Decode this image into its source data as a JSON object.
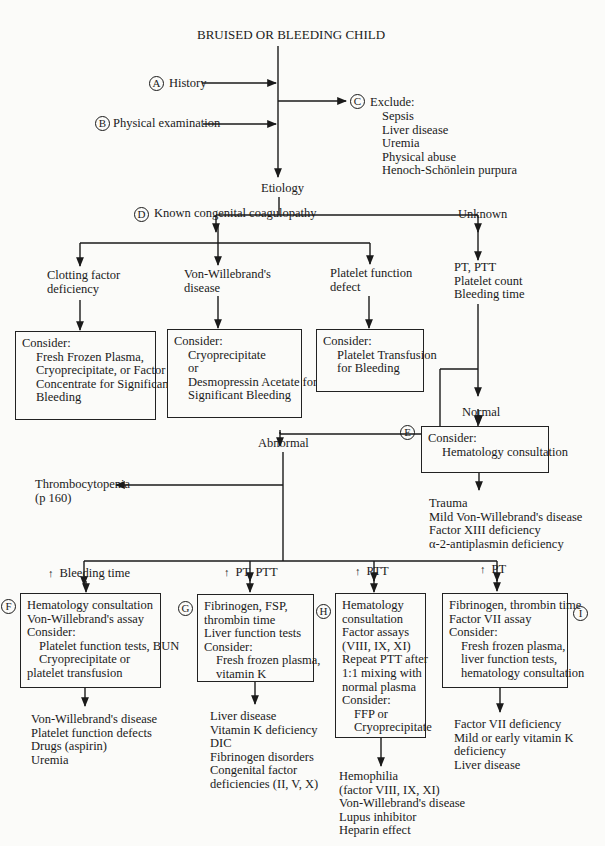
{
  "title": "BRUISED OR BLEEDING CHILD",
  "steps": {
    "A": {
      "letter": "A",
      "label": "History"
    },
    "B": {
      "letter": "B",
      "label": "Physical examination"
    },
    "C": {
      "letter": "C",
      "label": "Exclude:",
      "items": [
        "Sepsis",
        "Liver disease",
        "Uremia",
        "Physical abuse",
        "Henoch-Schönlein purpura"
      ]
    },
    "D": {
      "letter": "D",
      "label": "Known congenital coagulopathy"
    },
    "E": {
      "letter": "E"
    },
    "F": {
      "letter": "F"
    },
    "G": {
      "letter": "G"
    },
    "H": {
      "letter": "H"
    },
    "I": {
      "letter": "I"
    }
  },
  "etiology": "Etiology",
  "unknown": "Unknown",
  "known_branches": [
    {
      "label_lines": [
        "Clotting factor",
        "deficiency"
      ],
      "box": {
        "heading": "Consider:",
        "lines": [
          "Fresh Frozen Plasma,",
          "Cryoprecipitate, or Factor",
          "Concentrate for Significant",
          "Bleeding"
        ]
      }
    },
    {
      "label_lines": [
        "Von-Willebrand's",
        "disease"
      ],
      "box": {
        "heading": "Consider:",
        "lines": [
          "Cryoprecipitate",
          "or",
          "Desmopressin Acetate for",
          "Significant Bleeding"
        ]
      }
    },
    {
      "label_lines": [
        "Platelet function",
        "defect"
      ],
      "box": {
        "heading": "Consider:",
        "lines": [
          "Platelet Transfusion",
          "for Bleeding"
        ]
      }
    }
  ],
  "tests": [
    "PT, PTT",
    "Platelet count",
    "Bleeding time"
  ],
  "normal": "Normal",
  "abnormal": "Abnormal",
  "normal_box": {
    "heading": "Consider:",
    "lines": [
      "Hematology consultation"
    ]
  },
  "normal_outcomes": [
    "Trauma",
    "Mild Von-Willebrand's disease",
    "Factor XIII deficiency",
    "α-2-antiplasmin deficiency"
  ],
  "thrombocytopenia": {
    "label": "Thrombocytopenia",
    "ref": "(p 160)"
  },
  "abnormal_branches": [
    {
      "arrow": "↑",
      "label": "Bleeding time",
      "box": [
        "Hematology consultation",
        "Von-Willebrand's assay",
        "Consider:",
        "Platelet function tests, BUN",
        "Cryoprecipitate or",
        "platelet transfusion"
      ],
      "outcomes": [
        "Von-Willebrand's disease",
        "Platelet function defects",
        "Drugs (aspirin)",
        "Uremia"
      ]
    },
    {
      "arrow": "↑",
      "label": "PT, PTT",
      "box": [
        "Fibrinogen, FSP,",
        "thrombin time",
        "Liver function tests",
        "Consider:",
        "Fresh frozen plasma,",
        "vitamin K"
      ],
      "outcomes": [
        "Liver disease",
        "Vitamin K deficiency",
        "DIC",
        "Fibrinogen disorders",
        "Congenital factor",
        "deficiencies (II, V, X)"
      ]
    },
    {
      "arrow": "↑",
      "label": "PTT",
      "box": [
        "Hematology",
        "consultation",
        "Factor assays",
        "(VIII, IX, XI)",
        "Repeat PTT after",
        "1:1 mixing with",
        "normal plasma",
        "Consider:",
        "FFP or",
        "Cryoprecipitate"
      ],
      "outcomes": [
        "Hemophilia",
        "(factor VIII, IX, XI)",
        "Von-Willebrand's disease",
        "Lupus inhibitor",
        "Heparin effect"
      ]
    },
    {
      "arrow": "↑",
      "label": "PT",
      "box": [
        "Fibrinogen, thrombin time",
        "Factor VII assay",
        "Consider:",
        "Fresh frozen plasma,",
        "liver function tests,",
        "hematology consultation"
      ],
      "outcomes": [
        "Factor VII deficiency",
        "Mild or early vitamin K",
        "deficiency",
        "Liver disease"
      ]
    }
  ]
}
